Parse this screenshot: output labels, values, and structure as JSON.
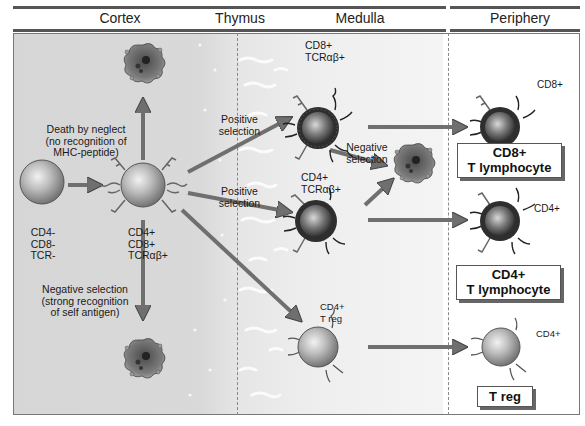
{
  "header": {
    "sections": [
      {
        "label": "Cortex"
      },
      {
        "label": "Thymus"
      },
      {
        "label": "Medulla"
      },
      {
        "label": "Periphery"
      }
    ]
  },
  "cells": {
    "double_negative": {
      "lines": [
        "CD4-",
        "CD8-",
        "TCR-"
      ]
    },
    "double_positive": {
      "lines": [
        "CD4+",
        "CD8+",
        "TCRαβ+"
      ]
    },
    "medulla_cd8": {
      "lines": [
        "CD8+",
        "TCRαβ+"
      ]
    },
    "medulla_cd4": {
      "lines": [
        "CD4+",
        "TCRαβ+"
      ]
    },
    "medulla_treg": {
      "lines": [
        "CD4+",
        "T reg"
      ]
    },
    "periphery_cd8": {
      "label": "CD8+"
    },
    "periphery_cd4": {
      "label": "CD4+"
    },
    "periphery_treg": {
      "label": "CD4+"
    }
  },
  "annotations": {
    "death_by_neglect": [
      "Death by neglect",
      "(no recognition of",
      "MHC-peptide)"
    ],
    "negative_selection_cortex": [
      "Negative selection",
      "(strong recognition",
      "of self antigen)"
    ],
    "positive_selection_top": [
      "Positive",
      "selection"
    ],
    "positive_selection_mid": [
      "Positive",
      "selection"
    ],
    "negative_selection_medulla": [
      "Negative",
      "selection"
    ]
  },
  "outcome_boxes": {
    "cd8": [
      "CD8+",
      "T lymphocyte"
    ],
    "cd4": [
      "CD4+",
      "T lymphocyte"
    ],
    "treg": [
      "T reg"
    ]
  },
  "colors": {
    "cortex_bg": "#d8d8d8",
    "medulla_bg": "#f2f2f2",
    "periphery_bg": "#ffffff",
    "arrow": "#7a7a7a",
    "cell_light": "#c8c8c8",
    "cell_dark": "#3a3a3a"
  }
}
